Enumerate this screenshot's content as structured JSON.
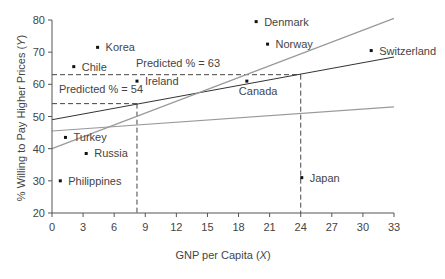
{
  "chart_data": {
    "type": "scatter",
    "title": "",
    "xlabel": "GNP per Capita (X)",
    "ylabel": "% Willing to Pay Higher Prices (Y)",
    "xlim": [
      0,
      33
    ],
    "ylim": [
      20,
      80
    ],
    "x_ticks": [
      0,
      3,
      6,
      9,
      12,
      15,
      18,
      21,
      24,
      27,
      30,
      33
    ],
    "y_ticks": [
      20,
      30,
      40,
      50,
      60,
      70,
      80
    ],
    "grid": false,
    "points": [
      {
        "label": "Korea",
        "x": 4.4,
        "y": 71.5
      },
      {
        "label": "Chile",
        "x": 2.1,
        "y": 65.5
      },
      {
        "label": "Ireland",
        "x": 8.2,
        "y": 61
      },
      {
        "label": "Turkey",
        "x": 1.3,
        "y": 43.5
      },
      {
        "label": "Russia",
        "x": 3.3,
        "y": 38.5
      },
      {
        "label": "Philippines",
        "x": 0.8,
        "y": 30
      },
      {
        "label": "Denmark",
        "x": 19.7,
        "y": 79.5
      },
      {
        "label": "Norway",
        "x": 20.8,
        "y": 72.5
      },
      {
        "label": "Canada",
        "x": 18.8,
        "y": 61
      },
      {
        "label": "Switzerland",
        "x": 30.8,
        "y": 70.5
      },
      {
        "label": "Japan",
        "x": 24.1,
        "y": 31
      }
    ],
    "lines": [
      {
        "name": "regression",
        "x": [
          0,
          33
        ],
        "y": [
          49,
          68.5
        ],
        "color": "#333333"
      },
      {
        "name": "steep",
        "x": [
          0,
          33
        ],
        "y": [
          40,
          80.5
        ],
        "color": "#999999"
      },
      {
        "name": "flat",
        "x": [
          0,
          33
        ],
        "y": [
          45.5,
          53
        ],
        "color": "#999999"
      }
    ],
    "annotations": [
      {
        "text": "Predicted % = 54",
        "x": 8.2,
        "y": 54
      },
      {
        "text": "Predicted % = 63",
        "x": 24,
        "y": 63
      }
    ],
    "reference_lines": [
      {
        "x": 8.2,
        "y": 54
      },
      {
        "x": 24,
        "y": 63
      }
    ]
  }
}
